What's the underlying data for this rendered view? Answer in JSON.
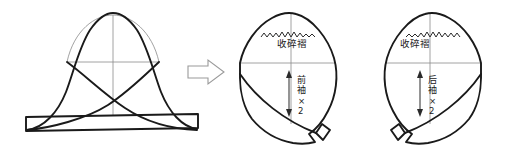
{
  "figure": {
    "kind": "garment-pattern-diagram",
    "background_color": "#ffffff",
    "line_color": "#1a1a1a",
    "construction_line_color": "#8a8a8a",
    "width": 521,
    "height": 149
  },
  "transform_arrow": {
    "icon": "right-block-arrow-icon",
    "direction": "right",
    "stroke_color": "#9a9a9a"
  },
  "panels": [
    {
      "id": "sleeve-block-draft",
      "role": "source-draft",
      "label": "",
      "has_centerline": true,
      "has_biceps_line": true,
      "has_crossing_diagonals": true,
      "has_hem_band": true
    },
    {
      "id": "front-sleeve-piece",
      "role": "front-sleeve",
      "gather_label": "收碎褶",
      "piece_label": "前袖",
      "quantity_label": "×2",
      "quantity": 2,
      "mirrored": false,
      "has_gather_zigzag": true,
      "has_dimension_arrow": true
    },
    {
      "id": "back-sleeve-piece",
      "role": "back-sleeve",
      "gather_label": "收碎褶",
      "piece_label": "后袖",
      "quantity_label": "×2",
      "quantity": 2,
      "mirrored": true,
      "has_gather_zigzag": true,
      "has_dimension_arrow": true
    }
  ]
}
